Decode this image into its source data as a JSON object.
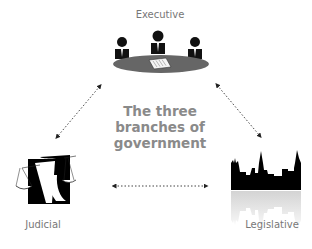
{
  "diagram": {
    "title_lines": [
      "The three",
      "branches of",
      "government"
    ],
    "nodes": {
      "executive": {
        "label": "Executive",
        "icon": "cabinet-meeting-icon"
      },
      "judicial": {
        "label": "Judicial",
        "icon": "scales-of-justice-icon"
      },
      "legislative": {
        "label": "Legislative",
        "icon": "parliament-skyline-icon"
      }
    },
    "connections": [
      {
        "from": "executive",
        "to": "judicial",
        "style": "dotted-double-arrow"
      },
      {
        "from": "executive",
        "to": "legislative",
        "style": "dotted-double-arrow"
      },
      {
        "from": "judicial",
        "to": "legislative",
        "style": "dotted-double-arrow"
      }
    ],
    "colors": {
      "text": "#777777",
      "title": "#8a8a8a",
      "icon": "#000000",
      "table": "#666666"
    }
  }
}
